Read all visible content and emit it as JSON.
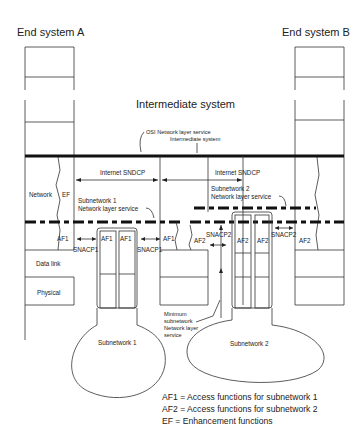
{
  "titles": {
    "end_system_a": "End system A",
    "end_system_b": "End system B",
    "intermediate_system": "Intermediate system"
  },
  "labels": {
    "osi_service_line1": "OSI Network layer service",
    "osi_service_line2": "Intermediate system",
    "internet_sndcp_left": "Internet SNDCP",
    "internet_sndcp_right": "Internet SNDCP",
    "subnet1_service_line1": "Subnetwork 1",
    "subnet1_service_line2": "Network layer service",
    "subnet2_service_line1": "Subnetwork 2",
    "subnet2_service_line2": "Network layer service",
    "network": "Network",
    "ef": "EF",
    "data_link": "Data link",
    "physical": "Physical",
    "af1_a": "AF1",
    "af1_b": "AF1",
    "af1_c": "AF1",
    "af1_d": "AF1",
    "af2_a": "AF2",
    "af2_b": "AF2",
    "af2_c": "AF2",
    "af2_d": "AF2",
    "snacp1_left": "SNACP1",
    "snacp1_right": "SNACP1",
    "snacp2_left": "SNACP2",
    "snacp2_right": "SNACP2",
    "minimum_line1": "Minimum",
    "minimum_line2": "subnetwork",
    "minimum_line3": "Network layer",
    "minimum_line4": "service",
    "subnetwork1": "Subnetwork 1",
    "subnetwork2": "Subnetwork 2"
  },
  "legend": [
    "AF1 = Access functions for subnetwork 1",
    "AF2 = Access functions for subnetwork 2",
    "EF = Enhancement functions"
  ]
}
